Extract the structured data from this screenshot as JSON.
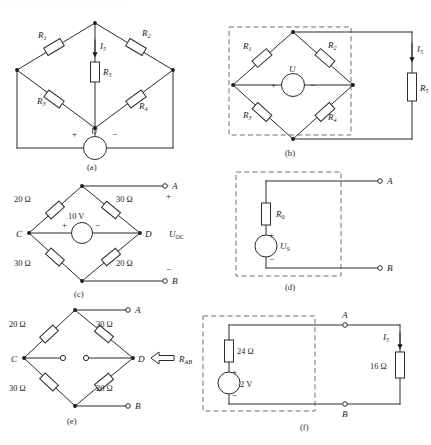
{
  "figure": {
    "background": "#ffffff",
    "ink": "#2b2b2b",
    "dash_color": "#6f6f6f",
    "faint_header": "··· ····· ··· ·· ···· ··· ····· ·· ···"
  },
  "panels": {
    "a": {
      "caption": "(a)",
      "resistors": [
        {
          "name": "R1",
          "base": "R",
          "sub": "1"
        },
        {
          "name": "R2",
          "base": "R",
          "sub": "2"
        },
        {
          "name": "R3",
          "base": "R",
          "sub": "3"
        },
        {
          "name": "R4",
          "base": "R",
          "sub": "4"
        },
        {
          "name": "R5",
          "base": "R",
          "sub": "5"
        }
      ],
      "current": {
        "base": "I",
        "sub": "5"
      },
      "source": {
        "label": "U",
        "plus": "+",
        "minus": "−"
      }
    },
    "b": {
      "caption": "(b)",
      "resistors": [
        {
          "name": "R1",
          "base": "R",
          "sub": "1"
        },
        {
          "name": "R2",
          "base": "R",
          "sub": "2"
        },
        {
          "name": "R3",
          "base": "R",
          "sub": "3"
        },
        {
          "name": "R4",
          "base": "R",
          "sub": "4"
        },
        {
          "name": "R5",
          "base": "R",
          "sub": "5"
        }
      ],
      "current": {
        "base": "I",
        "sub": "5"
      },
      "source": {
        "label": "U",
        "plus": "+",
        "minus": "−"
      }
    },
    "c": {
      "caption": "(c)",
      "r_top_left": "20 Ω",
      "r_top_right": "30 Ω",
      "r_bottom_left": "30 Ω",
      "r_bottom_right": "20 Ω",
      "source_value": "10 V",
      "source_plus": "+",
      "source_minus": "−",
      "node_c": "C",
      "node_d": "D",
      "node_a": "A",
      "node_b": "B",
      "terminal_plus": "+",
      "terminal_minus": "−",
      "output": {
        "base": "U",
        "sub": "OC"
      }
    },
    "d": {
      "caption": "(d)",
      "resistor": {
        "base": "R",
        "sub": "0"
      },
      "source": {
        "base": "U",
        "sub": "S"
      },
      "source_plus": "+",
      "source_minus": "−",
      "node_a": "A",
      "node_b": "B"
    },
    "e": {
      "caption": "(e)",
      "r_top_left": "20 Ω",
      "r_top_right": "30 Ω",
      "r_bottom_left": "30 Ω",
      "r_bottom_right": "20 Ω",
      "node_c": "C",
      "node_d": "D",
      "node_a": "A",
      "node_b": "B",
      "resistance": {
        "base": "R",
        "sub": "AB"
      }
    },
    "f": {
      "caption": "(f)",
      "r_internal": "24 Ω",
      "source_value": "2 V",
      "source_plus": "+",
      "source_minus": "−",
      "r_load": "16 Ω",
      "current": {
        "base": "I",
        "sub": "5"
      },
      "node_a": "A",
      "node_b": "B"
    }
  }
}
